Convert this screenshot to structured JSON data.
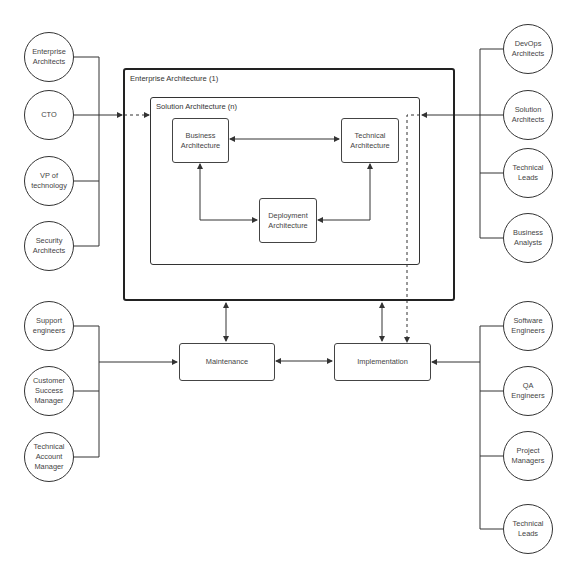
{
  "diagram": {
    "containers": {
      "enterprise": {
        "label": "Enterprise Architecture (1)"
      },
      "solution": {
        "label": "Solution Architecture (n)"
      }
    },
    "inner_boxes": {
      "business": {
        "label": "Business\nArchitecture"
      },
      "technical": {
        "label": "Technical\nArchitecture"
      },
      "deployment": {
        "label": "Deployment\nArchitecture"
      }
    },
    "process_boxes": {
      "maintenance": {
        "label": "Maintenance"
      },
      "implementation": {
        "label": "Implementation"
      }
    },
    "left_top_roles": [
      {
        "label": "Enterprise\nArchitects"
      },
      {
        "label": "CTO"
      },
      {
        "label": "VP of\ntechnology"
      },
      {
        "label": "Security\nArchitects"
      }
    ],
    "right_top_roles": [
      {
        "label": "DevOps\nArchitects"
      },
      {
        "label": "Solution\nArchitects"
      },
      {
        "label": "Technical\nLeads"
      },
      {
        "label": "Business\nAnalysts"
      }
    ],
    "left_bottom_roles": [
      {
        "label": "Support\nengineers"
      },
      {
        "label": "Customer\nSuccess\nManager"
      },
      {
        "label": "Technical\nAccount\nManager"
      }
    ],
    "right_bottom_roles": [
      {
        "label": "Software\nEngineers"
      },
      {
        "label": "QA\nEngineers"
      },
      {
        "label": "Project\nManagers"
      },
      {
        "label": "Technical\nLeads"
      }
    ],
    "colors": {
      "line": "#333333",
      "background": "#ffffff"
    }
  }
}
